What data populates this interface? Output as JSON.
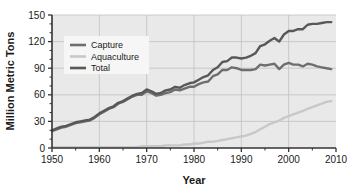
{
  "chart_data": {
    "type": "line",
    "title": "",
    "xlabel": "Year",
    "ylabel": "Million Metric Tons",
    "xlim": [
      1950,
      2010
    ],
    "ylim": [
      0,
      150
    ],
    "xticks": [
      1950,
      1960,
      1970,
      1980,
      1990,
      2000,
      2010
    ],
    "yticks": [
      0,
      30,
      60,
      90,
      120,
      150
    ],
    "grid": true,
    "legend_position": "upper-left",
    "x": [
      1950,
      1951,
      1952,
      1953,
      1954,
      1955,
      1956,
      1957,
      1958,
      1959,
      1960,
      1961,
      1962,
      1963,
      1964,
      1965,
      1966,
      1967,
      1968,
      1969,
      1970,
      1971,
      1972,
      1973,
      1974,
      1975,
      1976,
      1977,
      1978,
      1979,
      1980,
      1981,
      1982,
      1983,
      1984,
      1985,
      1986,
      1987,
      1988,
      1989,
      1990,
      1991,
      1992,
      1993,
      1994,
      1995,
      1996,
      1997,
      1998,
      1999,
      2000,
      2001,
      2002,
      2003,
      2004,
      2005,
      2006,
      2007,
      2008,
      2009
    ],
    "series": [
      {
        "name": "Capture",
        "color": "#6e6e6e",
        "values": [
          19,
          21,
          23,
          24,
          26,
          28,
          29,
          30,
          31,
          34,
          38,
          41,
          44,
          46,
          50,
          52,
          55,
          58,
          60,
          60,
          64,
          62,
          59,
          60,
          62,
          63,
          66,
          65,
          67,
          69,
          69,
          72,
          74,
          75,
          81,
          83,
          88,
          88,
          91,
          90,
          88,
          88,
          88,
          89,
          94,
          93,
          94,
          95,
          89,
          94,
          96,
          94,
          94,
          92,
          95,
          94,
          92,
          91,
          90,
          89
        ]
      },
      {
        "name": "Aquaculture",
        "color": "#c8c8c8",
        "values": [
          1,
          1,
          1,
          1,
          1,
          1,
          1,
          1,
          1,
          1,
          1,
          1,
          1,
          1,
          1,
          1,
          1,
          1,
          1,
          2,
          2,
          2,
          2,
          2,
          3,
          3,
          3,
          3,
          4,
          4,
          5,
          5,
          6,
          7,
          7,
          8,
          9,
          10,
          11,
          12,
          13,
          14,
          16,
          18,
          21,
          24,
          27,
          29,
          31,
          34,
          36,
          38,
          40,
          42,
          44,
          46,
          48,
          50,
          52,
          53
        ]
      },
      {
        "name": "Total",
        "color": "#585858",
        "values": [
          20,
          22,
          24,
          25,
          27,
          29,
          30,
          31,
          32,
          35,
          39,
          42,
          45,
          47,
          51,
          53,
          56,
          59,
          61,
          62,
          66,
          64,
          61,
          62,
          65,
          66,
          69,
          68,
          71,
          73,
          74,
          77,
          80,
          82,
          88,
          91,
          97,
          98,
          102,
          102,
          101,
          102,
          104,
          107,
          115,
          117,
          121,
          124,
          120,
          128,
          132,
          132,
          134,
          134,
          139,
          140,
          140,
          141,
          142,
          142
        ]
      }
    ]
  },
  "legend": {
    "items": [
      {
        "label": "Capture",
        "swatch": "#6e6e6e"
      },
      {
        "label": "Aquaculture",
        "swatch": "#c8c8c8"
      },
      {
        "label": "Total",
        "swatch": "#585858"
      }
    ]
  },
  "axes": {
    "x_title": "Year",
    "y_title": "Million Metric Tons",
    "x_tick_labels": [
      "1950",
      "1960",
      "1970",
      "1980",
      "1990",
      "2000",
      "2010"
    ],
    "y_tick_labels": [
      "0",
      "30",
      "60",
      "90",
      "120",
      "150"
    ]
  },
  "colors": {
    "plot_background": "#e9e9e9",
    "gridline": "#c0c0c0",
    "axis": "#333333",
    "legend_background": "#f6f6f6",
    "text": "#1a1a1a"
  }
}
